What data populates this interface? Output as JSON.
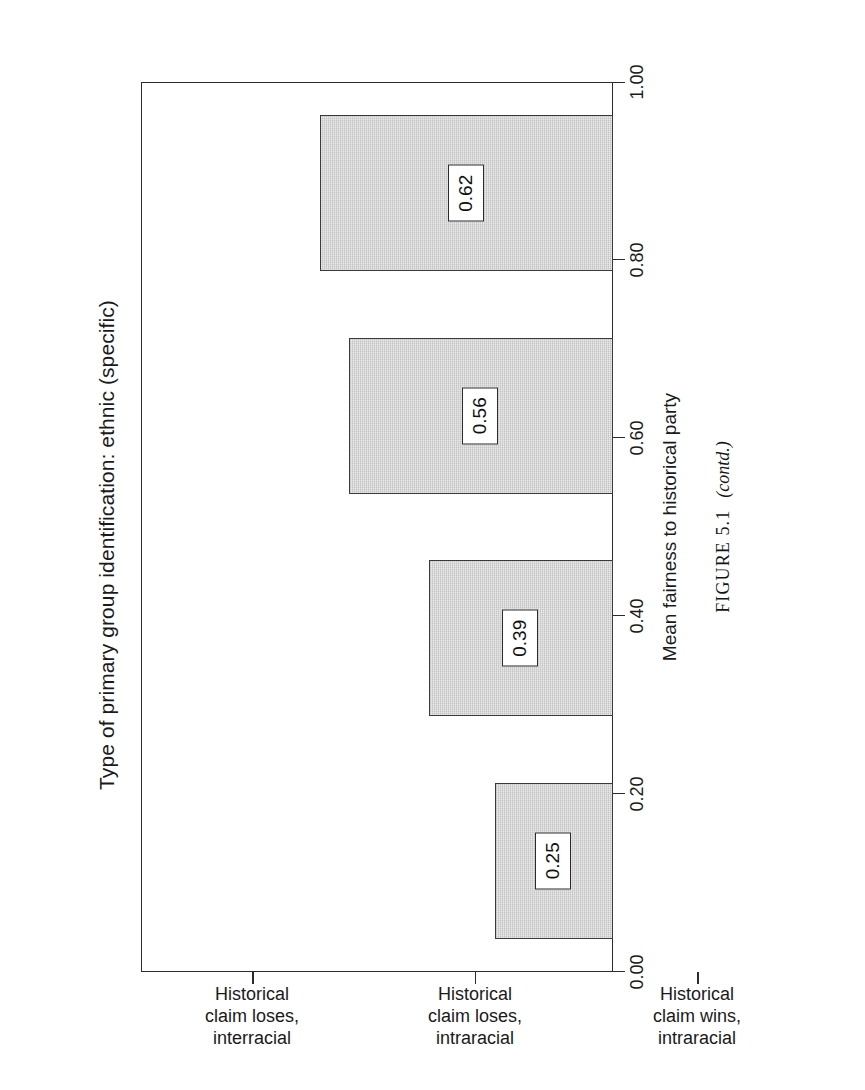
{
  "page": {
    "orientation": "rotated-90-ccw",
    "background_color": "#ffffff"
  },
  "figure": {
    "caption_label": "FIGURE 5.1",
    "caption_note": "(contd.)"
  },
  "chart_data": {
    "type": "bar",
    "orientation": "vertical-printed-rotated",
    "title": "Type of primary group identification: ethnic (specific)",
    "xlabel": "Combination of who wins and disputants' races",
    "ylabel": "Mean fairness to historical party",
    "categories": [
      "Historical claim loses, interracial",
      "Historical claim loses, intraracial",
      "Historical claim wins, intraracial",
      "Historical claim Wins, interracial"
    ],
    "category_lines": [
      [
        "Historical",
        "claim loses,",
        "interracial"
      ],
      [
        "Historical",
        "claim loses,",
        "intraracial"
      ],
      [
        "Historical",
        "claim wins,",
        "intraracial"
      ],
      [
        "Historical",
        "claim Wins,",
        "interracial"
      ]
    ],
    "values": [
      0.25,
      0.39,
      0.56,
      0.62
    ],
    "value_labels": [
      "0.25",
      "0.39",
      "0.56",
      "0.62"
    ],
    "ylim": [
      0.0,
      1.0
    ],
    "yticks": [
      0.0,
      0.2,
      0.4,
      0.6,
      0.8,
      1.0
    ],
    "ytick_labels": [
      "0.00",
      "0.20",
      "0.40",
      "0.60",
      "0.80",
      "1.00"
    ],
    "grid": false,
    "legend": false,
    "bar_fill_color": "#c3c3c3",
    "bar_border_color": "#3a3a3a",
    "axis_color": "#2b2b2b",
    "text_color": "#1a1a1a"
  }
}
